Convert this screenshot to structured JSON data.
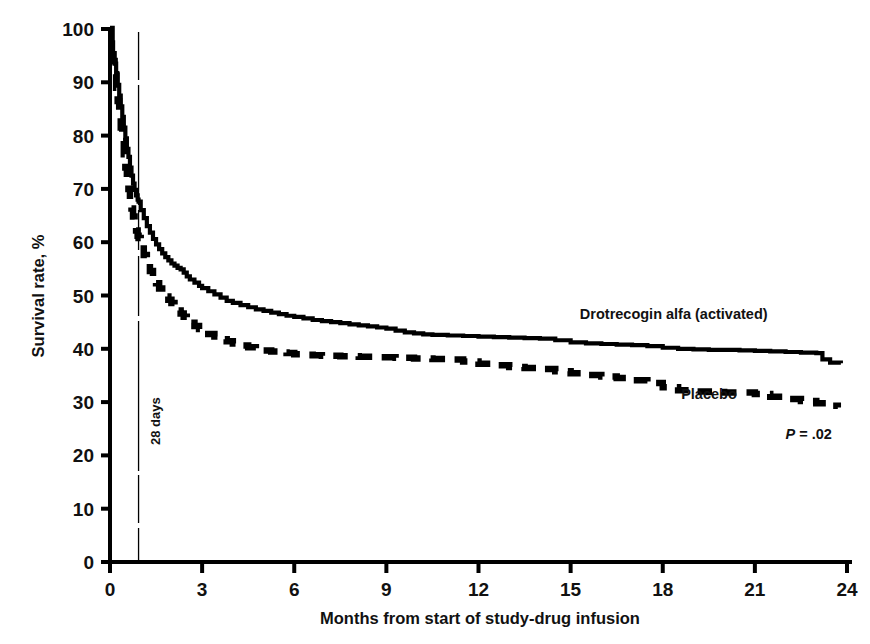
{
  "chart_data": {
    "type": "line",
    "subtype": "kaplan-meier-survival",
    "title": "",
    "xlabel": "Months from start of study-drug infusion",
    "ylabel": "Survival rate, %",
    "xlim": [
      0,
      24
    ],
    "ylim": [
      0,
      100
    ],
    "xticks": [
      0,
      3,
      6,
      9,
      12,
      15,
      18,
      21,
      24
    ],
    "xtick_labels": [
      "0",
      "3",
      "6",
      "9",
      "12",
      "15",
      "18",
      "21",
      "24"
    ],
    "yticks": [
      0,
      10,
      20,
      30,
      40,
      50,
      60,
      70,
      80,
      90,
      100
    ],
    "ytick_labels": [
      "0",
      "10",
      "20",
      "30",
      "40",
      "50",
      "60",
      "70",
      "80",
      "90",
      "100"
    ],
    "grid": false,
    "legend_position": "inline-annotation",
    "annotations": [
      {
        "name": "28-days-marker",
        "text": "28 days",
        "x": 0.93,
        "orientation": "vertical",
        "type": "vertical-reference-line"
      },
      {
        "name": "p-value",
        "text": "P = .02",
        "italic_prefix": "P",
        "rest": " = .02",
        "x": 22.0,
        "y": 23
      }
    ],
    "series": [
      {
        "name": "Drotrecogin alfa (activated)",
        "style": "solid",
        "color": "#000000",
        "label_x": 15.3,
        "label_y": 45.5,
        "points": [
          [
            0.0,
            100
          ],
          [
            0.05,
            97.5
          ],
          [
            0.1,
            95.5
          ],
          [
            0.15,
            93.5
          ],
          [
            0.2,
            91.5
          ],
          [
            0.25,
            89.5
          ],
          [
            0.3,
            87.5
          ],
          [
            0.35,
            85.5
          ],
          [
            0.4,
            83.5
          ],
          [
            0.45,
            81.5
          ],
          [
            0.5,
            79.5
          ],
          [
            0.55,
            77.5
          ],
          [
            0.6,
            76.0
          ],
          [
            0.65,
            74.0
          ],
          [
            0.7,
            72.5
          ],
          [
            0.75,
            71.0
          ],
          [
            0.8,
            69.8
          ],
          [
            0.85,
            68.8
          ],
          [
            0.9,
            68.0
          ],
          [
            0.93,
            67.6
          ],
          [
            1.0,
            66.0
          ],
          [
            1.1,
            64.5
          ],
          [
            1.2,
            63.0
          ],
          [
            1.3,
            61.8
          ],
          [
            1.4,
            60.6
          ],
          [
            1.5,
            59.6
          ],
          [
            1.6,
            58.7
          ],
          [
            1.7,
            57.9
          ],
          [
            1.8,
            57.2
          ],
          [
            1.9,
            56.6
          ],
          [
            2.0,
            56.0
          ],
          [
            2.1,
            55.6
          ],
          [
            2.2,
            55.2
          ],
          [
            2.3,
            54.9
          ],
          [
            2.4,
            54.3
          ],
          [
            2.5,
            53.6
          ],
          [
            2.6,
            53.0
          ],
          [
            2.75,
            52.4
          ],
          [
            2.9,
            51.8
          ],
          [
            3.0,
            51.4
          ],
          [
            3.2,
            50.8
          ],
          [
            3.4,
            50.2
          ],
          [
            3.6,
            49.6
          ],
          [
            3.8,
            49.0
          ],
          [
            4.0,
            48.6
          ],
          [
            4.25,
            48.2
          ],
          [
            4.5,
            47.8
          ],
          [
            4.75,
            47.4
          ],
          [
            5.0,
            47.1
          ],
          [
            5.25,
            46.8
          ],
          [
            5.5,
            46.5
          ],
          [
            5.75,
            46.2
          ],
          [
            6.0,
            46.0
          ],
          [
            6.3,
            45.7
          ],
          [
            6.6,
            45.4
          ],
          [
            6.9,
            45.2
          ],
          [
            7.2,
            45.0
          ],
          [
            7.5,
            44.8
          ],
          [
            7.8,
            44.6
          ],
          [
            8.1,
            44.4
          ],
          [
            8.4,
            44.2
          ],
          [
            8.7,
            44.0
          ],
          [
            9.0,
            43.8
          ],
          [
            9.3,
            43.4
          ],
          [
            9.6,
            43.1
          ],
          [
            9.9,
            42.9
          ],
          [
            10.2,
            42.7
          ],
          [
            10.5,
            42.6
          ],
          [
            11.0,
            42.5
          ],
          [
            11.5,
            42.4
          ],
          [
            12.0,
            42.3
          ],
          [
            12.5,
            42.2
          ],
          [
            13.0,
            42.1
          ],
          [
            13.5,
            42.0
          ],
          [
            14.0,
            41.9
          ],
          [
            14.5,
            41.6
          ],
          [
            15.0,
            41.2
          ],
          [
            15.5,
            41.0
          ],
          [
            16.0,
            40.9
          ],
          [
            16.5,
            40.8
          ],
          [
            17.0,
            40.7
          ],
          [
            17.5,
            40.5
          ],
          [
            18.0,
            40.2
          ],
          [
            18.5,
            40.0
          ],
          [
            19.0,
            39.9
          ],
          [
            19.5,
            39.8
          ],
          [
            20.0,
            39.8
          ],
          [
            20.5,
            39.7
          ],
          [
            21.0,
            39.6
          ],
          [
            21.5,
            39.5
          ],
          [
            22.0,
            39.4
          ],
          [
            22.5,
            39.3
          ],
          [
            23.0,
            39.2
          ],
          [
            23.2,
            38.0
          ],
          [
            23.45,
            37.4
          ],
          [
            23.8,
            37.3
          ]
        ]
      },
      {
        "name": "Placebo",
        "style": "dashed",
        "color": "#000000",
        "label_x": 18.6,
        "label_y": 30.5,
        "points": [
          [
            0.0,
            100
          ],
          [
            0.05,
            96.5
          ],
          [
            0.1,
            94.0
          ],
          [
            0.15,
            91.5
          ],
          [
            0.2,
            89.0
          ],
          [
            0.25,
            86.5
          ],
          [
            0.3,
            84.0
          ],
          [
            0.35,
            81.5
          ],
          [
            0.4,
            79.0
          ],
          [
            0.45,
            76.5
          ],
          [
            0.5,
            74.0
          ],
          [
            0.55,
            72.0
          ],
          [
            0.6,
            70.0
          ],
          [
            0.65,
            68.0
          ],
          [
            0.7,
            66.3
          ],
          [
            0.75,
            64.8
          ],
          [
            0.8,
            63.4
          ],
          [
            0.85,
            62.2
          ],
          [
            0.9,
            61.2
          ],
          [
            0.93,
            60.8
          ],
          [
            1.0,
            59.5
          ],
          [
            1.1,
            57.6
          ],
          [
            1.2,
            56.0
          ],
          [
            1.3,
            54.6
          ],
          [
            1.4,
            53.4
          ],
          [
            1.5,
            52.3
          ],
          [
            1.6,
            51.3
          ],
          [
            1.7,
            50.5
          ],
          [
            1.8,
            49.8
          ],
          [
            1.9,
            49.2
          ],
          [
            2.0,
            48.6
          ],
          [
            2.1,
            47.9
          ],
          [
            2.2,
            47.2
          ],
          [
            2.3,
            46.6
          ],
          [
            2.4,
            46.0
          ],
          [
            2.5,
            45.4
          ],
          [
            2.6,
            44.9
          ],
          [
            2.75,
            44.3
          ],
          [
            2.9,
            43.7
          ],
          [
            3.0,
            43.4
          ],
          [
            3.2,
            42.8
          ],
          [
            3.4,
            42.3
          ],
          [
            3.6,
            41.8
          ],
          [
            3.8,
            41.4
          ],
          [
            4.0,
            41.0
          ],
          [
            4.25,
            40.6
          ],
          [
            4.5,
            40.3
          ],
          [
            4.75,
            40.0
          ],
          [
            5.0,
            39.7
          ],
          [
            5.25,
            39.5
          ],
          [
            5.5,
            39.3
          ],
          [
            5.75,
            39.2
          ],
          [
            6.0,
            39.0
          ],
          [
            6.3,
            38.9
          ],
          [
            6.6,
            38.8
          ],
          [
            6.9,
            38.7
          ],
          [
            7.2,
            38.7
          ],
          [
            7.5,
            38.6
          ],
          [
            7.8,
            38.6
          ],
          [
            8.1,
            38.5
          ],
          [
            8.4,
            38.5
          ],
          [
            8.7,
            38.4
          ],
          [
            9.0,
            38.4
          ],
          [
            9.3,
            38.3
          ],
          [
            9.6,
            38.3
          ],
          [
            9.9,
            38.2
          ],
          [
            10.2,
            38.2
          ],
          [
            10.5,
            38.1
          ],
          [
            11.0,
            38.0
          ],
          [
            11.5,
            37.6
          ],
          [
            12.0,
            37.2
          ],
          [
            12.5,
            36.9
          ],
          [
            13.0,
            36.6
          ],
          [
            13.5,
            36.4
          ],
          [
            14.0,
            36.2
          ],
          [
            14.5,
            35.8
          ],
          [
            15.0,
            35.4
          ],
          [
            15.5,
            35.1
          ],
          [
            16.0,
            34.8
          ],
          [
            16.5,
            34.5
          ],
          [
            17.0,
            34.1
          ],
          [
            17.5,
            33.6
          ],
          [
            18.0,
            32.8
          ],
          [
            18.5,
            32.2
          ],
          [
            19.0,
            32.0
          ],
          [
            19.5,
            31.9
          ],
          [
            20.0,
            31.8
          ],
          [
            20.5,
            31.8
          ],
          [
            21.0,
            31.5
          ],
          [
            21.5,
            31.0
          ],
          [
            22.0,
            30.6
          ],
          [
            22.5,
            30.2
          ],
          [
            23.0,
            29.8
          ],
          [
            23.4,
            29.3
          ],
          [
            23.7,
            29.0
          ]
        ]
      }
    ]
  },
  "axes": {
    "y_axis_title": "Survival rate, %",
    "x_axis_title": "Months from start of study-drug infusion"
  }
}
